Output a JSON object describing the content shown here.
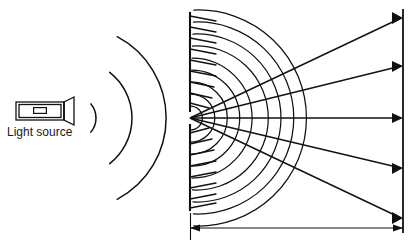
{
  "figure": {
    "type": "physics-optics-diagram",
    "background_color": "#ffffff",
    "stroke_color": "#111111",
    "canvas": {
      "width": 420,
      "height": 248
    }
  },
  "labels": {
    "light_source": "Light source",
    "bottom_caption": ""
  },
  "light_source": {
    "icon": "flashlight-icon",
    "body": {
      "x": 16,
      "y": 102,
      "width": 48,
      "height": 18
    },
    "inner_switch": {
      "x": 33,
      "y": 107,
      "width": 14,
      "height": 7
    },
    "head": {
      "x": 64,
      "y": 98,
      "width": 10,
      "height": 26
    }
  },
  "incoming_wavefronts": {
    "count": 3,
    "center_y": 118,
    "origin_x": 74,
    "radii": [
      22,
      58,
      92
    ],
    "arc_half_angle_deg": [
      40,
      52,
      62
    ]
  },
  "barrier": {
    "name": "slit-barrier",
    "x": 190,
    "y_top": 13,
    "y_bottom": 210,
    "slit_center_y": 118,
    "slit_half_height": 7
  },
  "huygens_wavelets": {
    "description": "circular wavelets spreading from the slit",
    "center_x": 190,
    "center_y": 118,
    "radii": [
      12,
      24,
      36,
      48,
      60,
      72,
      84,
      96,
      108
    ],
    "half_angle_deg": 88
  },
  "barrier_hatching": {
    "description": "short slanted strokes along barrier above and below the slit",
    "stroke_length": 26,
    "slant_deg": 20,
    "spacing": 11
  },
  "rays": {
    "origin_x": 190,
    "origin_y": 118,
    "screen_x": 403,
    "targets_y": [
      18,
      66,
      118,
      168,
      218
    ],
    "count": 5
  },
  "screen": {
    "name": "detection-screen",
    "x": 403,
    "y_top": 10,
    "y_bottom": 232
  },
  "dimension": {
    "name": "slit-to-screen-distance",
    "y": 228,
    "x_start": 190,
    "x_end": 403,
    "tick_top": 213,
    "tick_bottom": 240,
    "label": ""
  }
}
